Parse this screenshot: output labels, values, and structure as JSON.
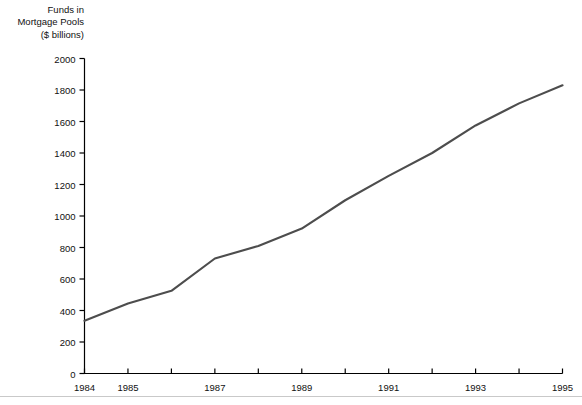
{
  "chart_data": {
    "type": "line",
    "title": "Funds in Mortgage Pools ($ billions)",
    "title_lines": [
      "Funds in",
      "Mortgage Pools",
      "($ billions)"
    ],
    "xlabel": "",
    "ylabel": "",
    "x": [
      1984,
      1985,
      1986,
      1987,
      1988,
      1989,
      1990,
      1991,
      1992,
      1993,
      1994,
      1995
    ],
    "values": [
      335,
      445,
      525,
      730,
      810,
      920,
      1100,
      1255,
      1400,
      1575,
      1715,
      1830
    ],
    "series": [
      {
        "name": "Funds in Mortgage Pools",
        "values": [
          335,
          445,
          525,
          730,
          810,
          920,
          1100,
          1255,
          1400,
          1575,
          1715,
          1830
        ]
      }
    ],
    "xlim": [
      1984,
      1995
    ],
    "ylim": [
      0,
      2000
    ],
    "ytick_labels": [
      "0",
      "200",
      "400",
      "600",
      "800",
      "1000",
      "1200",
      "1400",
      "1600",
      "1800",
      "2000"
    ],
    "ytick_values": [
      0,
      200,
      400,
      600,
      800,
      1000,
      1200,
      1400,
      1600,
      1800,
      2000
    ],
    "xtick_values": [
      1984,
      1985,
      1986,
      1987,
      1988,
      1989,
      1990,
      1991,
      1992,
      1993,
      1994,
      1995
    ],
    "xtick_labels": [
      "1984",
      "1985",
      "",
      "1987",
      "",
      "1989",
      "",
      "1991",
      "",
      "1993",
      "",
      "1995"
    ],
    "grid": false,
    "legend": false,
    "line_color": "#4d4d4d",
    "axis_color": "#000000"
  }
}
